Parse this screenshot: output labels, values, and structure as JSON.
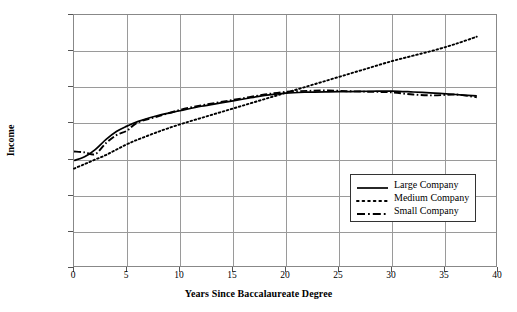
{
  "chart_data": {
    "type": "line",
    "title": "",
    "xlabel": "Years Since Baccalaureate Degree",
    "ylabel": "Income",
    "xlim": [
      0,
      40
    ],
    "ylim": [
      0,
      140000
    ],
    "grid": true,
    "legend_position": "inside-lower-right",
    "x_ticks": [
      "0",
      "5",
      "10",
      "15",
      "20",
      "25",
      "30",
      "35",
      "40"
    ],
    "x_tick_values": [
      0,
      5,
      10,
      15,
      20,
      25,
      30,
      35,
      40
    ],
    "y_ticks": [
      "$0",
      "$20,000",
      "$40,000",
      "$60,000",
      "$80,000",
      "$100,000",
      "$120,000",
      "$140,000"
    ],
    "y_tick_values": [
      0,
      20000,
      40000,
      60000,
      80000,
      100000,
      120000,
      140000
    ],
    "x": [
      0,
      1,
      2,
      3,
      4,
      5,
      6,
      8,
      10,
      12,
      14,
      16,
      18,
      20,
      22,
      24,
      26,
      28,
      30,
      32,
      34,
      36,
      38
    ],
    "series": [
      {
        "name": "Large Company",
        "style": "solid",
        "color": "#000000",
        "values": [
          59500,
          61500,
          65500,
          71000,
          75500,
          78500,
          81000,
          84500,
          87000,
          89500,
          91500,
          93500,
          95500,
          96800,
          97300,
          97500,
          97600,
          97800,
          97900,
          97400,
          96800,
          96000,
          95200
        ]
      },
      {
        "name": "Medium Company",
        "style": "dotted",
        "color": "#000000",
        "values": [
          55000,
          57500,
          60000,
          62500,
          65500,
          68500,
          71000,
          75500,
          79500,
          83000,
          86500,
          90000,
          93500,
          97000,
          100500,
          104000,
          107500,
          111000,
          114500,
          117500,
          120500,
          124000,
          128000
        ]
      },
      {
        "name": "Small Company",
        "style": "dashdot",
        "color": "#000000",
        "values": [
          64500,
          64000,
          63000,
          69000,
          73500,
          76000,
          80500,
          84000,
          87500,
          90000,
          92000,
          94000,
          96000,
          97500,
          98000,
          98200,
          97800,
          97500,
          97200,
          96000,
          95500,
          96000,
          94500
        ]
      }
    ]
  },
  "legend": {
    "items": [
      {
        "label": "Large Company",
        "style": "solid"
      },
      {
        "label": "Medium Company",
        "style": "dotted"
      },
      {
        "label": "Small Company",
        "style": "dashdot"
      }
    ]
  }
}
